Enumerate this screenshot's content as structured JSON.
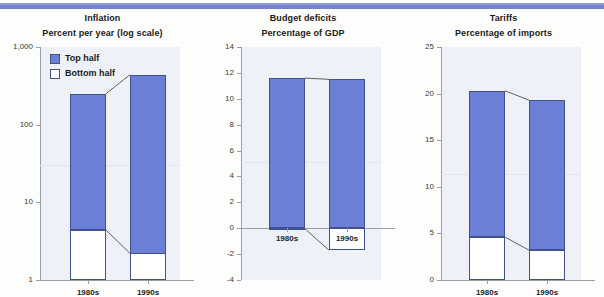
{
  "banner": {
    "color": "#7683ce"
  },
  "legend": {
    "items": [
      {
        "label": "Top half",
        "swatch": "blue",
        "color": "#6b7fd7"
      },
      {
        "label": "Bottom half",
        "swatch": "white",
        "color": "#ffffff"
      }
    ]
  },
  "colors": {
    "top_half": "#6b7fd7",
    "bottom_half": "#ffffff",
    "plot_bg": "#eef2f8",
    "axis": "#9aa0a6"
  },
  "chart_data": [
    {
      "type": "bar",
      "title": "Inflation",
      "subtitle": "Percent per year (log scale)",
      "xlabel": "",
      "ylabel": "Percent per year (log scale)",
      "scale": "log",
      "ylim": [
        1,
        1000
      ],
      "yticks": [
        1,
        10,
        100,
        1000
      ],
      "ytick_labels": [
        "1",
        "10",
        "100",
        "1,000"
      ],
      "categories": [
        "1980s",
        "1990s"
      ],
      "stacked": true,
      "series": [
        {
          "name": "Top half",
          "values": [
            250,
            440
          ]
        },
        {
          "name": "Bottom half",
          "values": [
            4.4,
            2.2
          ]
        }
      ],
      "grid": false,
      "legend_position": "top-left"
    },
    {
      "type": "bar",
      "title": "Budget deficits",
      "subtitle": "Percentage of GDP",
      "xlabel": "",
      "ylabel": "Percentage of GDP",
      "scale": "linear",
      "ylim": [
        -4,
        14
      ],
      "yticks": [
        -4,
        -2,
        0,
        2,
        4,
        6,
        8,
        10,
        12,
        14
      ],
      "ytick_labels": [
        "-4",
        "-2",
        "0",
        "2",
        "4",
        "6",
        "8",
        "10",
        "12",
        "14"
      ],
      "categories": [
        "1980s",
        "1990s"
      ],
      "stacked": true,
      "series": [
        {
          "name": "Top half",
          "values": [
            11.6,
            11.5
          ]
        },
        {
          "name": "Bottom half",
          "values": [
            -0.05,
            -1.7
          ]
        }
      ],
      "grid": false,
      "legend_position": "none"
    },
    {
      "type": "bar",
      "title": "Tariffs",
      "subtitle": "Percentage of imports",
      "xlabel": "",
      "ylabel": "Percentage of imports",
      "scale": "linear",
      "ylim": [
        0,
        25
      ],
      "yticks": [
        0,
        5,
        10,
        15,
        20,
        25
      ],
      "ytick_labels": [
        "0",
        "5",
        "10",
        "15",
        "20",
        "25"
      ],
      "categories": [
        "1980s",
        "1990s"
      ],
      "stacked": true,
      "series": [
        {
          "name": "Top half",
          "values": [
            20.3,
            19.3
          ]
        },
        {
          "name": "Bottom half",
          "values": [
            4.6,
            3.2
          ]
        }
      ],
      "grid": false,
      "legend_position": "none"
    }
  ]
}
